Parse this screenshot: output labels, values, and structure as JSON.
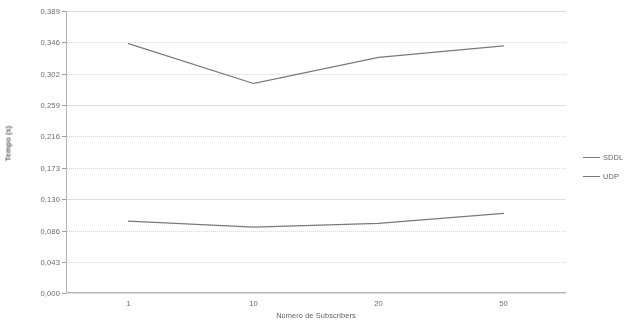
{
  "chart_data": {
    "type": "line",
    "title": "",
    "xlabel": "Número de Subscribers",
    "ylabel": "Tempo (s)",
    "categories": [
      "1",
      "10",
      "20",
      "50"
    ],
    "series": [
      {
        "name": "SDDL",
        "values": [
          0.344,
          0.289,
          0.325,
          0.341
        ],
        "color": "#6e6e6e"
      },
      {
        "name": "UDP",
        "values": [
          0.099,
          0.091,
          0.096,
          0.11
        ],
        "color": "#6e6e6e"
      }
    ],
    "ylim": [
      0.0,
      0.389
    ],
    "ytick_labels": [
      "0,389",
      "0,346",
      "0,302",
      "0,259",
      "0,216",
      "0,173",
      "0,130",
      "0,086",
      "0,043",
      "0,000"
    ],
    "ytick_values": [
      0.389,
      0.346,
      0.302,
      0.259,
      0.216,
      0.173,
      0.13,
      0.086,
      0.043,
      0.0
    ],
    "grid": true,
    "grid_orientation": "horizontal",
    "legend_position": "right",
    "decimal_separator": ",",
    "background_color": "#ffffff",
    "axis_color": "#b4b4b4",
    "grid_color": "#cfcfcf"
  }
}
